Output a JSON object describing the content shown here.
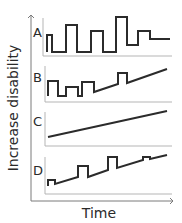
{
  "figure": {
    "y_axis_label": "Increase disability",
    "x_axis_label": "Time",
    "line_color": "#2b2b2b",
    "axis_color": "#7a7a7a",
    "panel_axis_color": "#b5b5b5",
    "panels": [
      {
        "id": "A",
        "label": "A",
        "label_pos": [
          33,
          37
        ],
        "axis": {
          "x": 43,
          "top": 18,
          "bottom": 56,
          "right": 172
        },
        "points": "47,52 47,35 52,35 52,52 66,52 66,25 77,25 77,52 91,52 91,31 103,31 103,52 116,52 116,17 127,17 127,45 138,45 138,31 150,31 150,39 170,39"
      },
      {
        "id": "B",
        "label": "B",
        "label_pos": [
          33,
          82
        ],
        "axis": {
          "x": 45,
          "top": 66,
          "bottom": 102,
          "right": 172
        },
        "points": "48,96 48,81 58,81 58,96 66,96 66,87 78,87 78,96 82,96 82,82 94,82 94,92 118,84 118,73 127,73 127,83 167,69"
      },
      {
        "id": "C",
        "label": "C",
        "label_pos": [
          33,
          126
        ],
        "axis": {
          "x": 45,
          "top": 112,
          "bottom": 146,
          "right": 172
        },
        "points": "48,137 167,111"
      },
      {
        "id": "D",
        "label": "D",
        "label_pos": [
          33,
          175
        ],
        "axis": {
          "x": 45,
          "top": 157,
          "bottom": 194,
          "right": 172
        },
        "points": "48,186 48,180 55,180 55,184 78,177 78,166 88,166 88,177 108,170 108,157 117,157 117,168 143,160 143,157 150,157 150,159 167,155"
      }
    ]
  }
}
